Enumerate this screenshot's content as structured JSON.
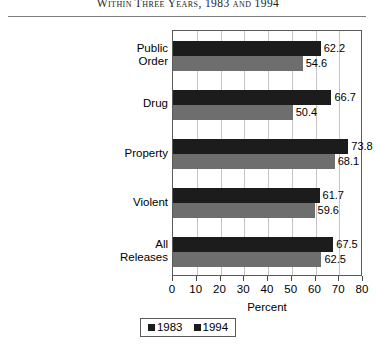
{
  "title": "Within Three Years, 1983 and 1994",
  "chart_data": {
    "type": "bar",
    "orientation": "horizontal",
    "title": "Within Three Years, 1983 and 1994",
    "xlabel": "Percent",
    "ylabel": "",
    "xlim": [
      0,
      80
    ],
    "xticks": [
      0,
      10,
      20,
      30,
      40,
      50,
      60,
      70,
      80
    ],
    "grid": true,
    "legend_position": "bottom",
    "categories": [
      "Public Order",
      "Drug",
      "Property",
      "Violent",
      "All Releases"
    ],
    "series": [
      {
        "name": "1983",
        "color": "#1c1c1c",
        "values": [
          62.2,
          66.7,
          73.8,
          61.7,
          67.5
        ]
      },
      {
        "name": "1994",
        "color": "#6e6e6e",
        "values": [
          54.6,
          50.4,
          68.1,
          59.6,
          62.5
        ]
      }
    ]
  },
  "categories": [
    {
      "line1": "Public",
      "line2": "Order"
    },
    {
      "line1": "Drug",
      "line2": ""
    },
    {
      "line1": "Property",
      "line2": ""
    },
    {
      "line1": "Violent",
      "line2": ""
    },
    {
      "line1": "All",
      "line2": "Releases"
    }
  ],
  "legend": [
    {
      "label": "1983"
    },
    {
      "label": "1994"
    }
  ],
  "axis": {
    "xlabel": "Percent",
    "ticks": [
      "0",
      "10",
      "20",
      "30",
      "40",
      "50",
      "60",
      "70",
      "80"
    ]
  }
}
